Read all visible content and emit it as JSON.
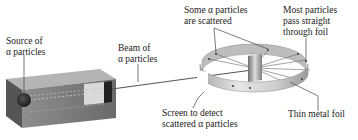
{
  "diagram": {
    "labels": {
      "source": [
        "Source of",
        "α particles"
      ],
      "beam": [
        "Beam of",
        "α particles"
      ],
      "scattered": [
        "Some α particles",
        "are scattered"
      ],
      "straight": [
        "Most particles",
        "pass straight",
        "through foil"
      ],
      "screen": [
        "Screen to detect",
        "scattered α particles"
      ],
      "foil": [
        "Thin metal foil"
      ]
    },
    "colors": {
      "box_front": "#7a7a7a",
      "box_top": "#b5b5b5",
      "box_side": "#3a3a3a",
      "ring": "#c8c8c8",
      "ring_dark": "#8a8a8a",
      "beam": "#555555",
      "leader": "#444444"
    }
  }
}
